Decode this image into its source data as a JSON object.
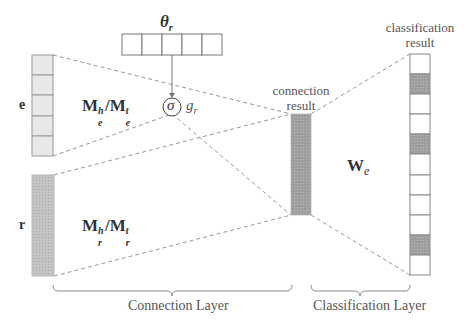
{
  "labels": {
    "theta": "θ",
    "theta_sub": "r",
    "sigma": "σ",
    "gate": "g",
    "gate_sub": "r",
    "entity": "e",
    "relation": "r",
    "entity_matrix": {
      "base": "M",
      "sup1": "h",
      "sub1": "e",
      "sep": "/",
      "sup2": "t",
      "sub2": "e"
    },
    "relation_matrix": {
      "base": "M",
      "sup1": "h",
      "sub1": "r",
      "sep": "/",
      "sup2": "t",
      "sub2": "r"
    },
    "connection_result": [
      "connection",
      "result"
    ],
    "classification_result": [
      "classification",
      "result"
    ],
    "weight": "W",
    "weight_sub": "e",
    "connection_layer": "Connection Layer",
    "classification_layer": "Classification Layer"
  },
  "structure": {
    "theta_cells": 5,
    "entity_cells": 5,
    "classification_cells": 11,
    "classification_shaded": [
      1,
      4,
      9
    ]
  },
  "colors": {
    "line": "#888888",
    "light_fill": "#e6e6e6",
    "dark_fill": "#a8a8a8",
    "medium_fill": "#c8c8c8"
  }
}
